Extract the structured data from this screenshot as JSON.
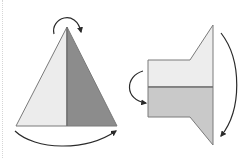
{
  "figure": {
    "colors": {
      "background": "#ffffff",
      "outline": "#7a7a7a",
      "arrow": "#2a2a2a",
      "triangle_left_fill": "#ececec",
      "triangle_right_fill": "#8c8c8c",
      "shape_top_fill": "#ededed",
      "shape_bottom_fill": "#c9c9c9",
      "dotted_edge": "#d6d6d6"
    },
    "left_diagram": {
      "shape": "triangle",
      "halves": [
        "light",
        "dark"
      ],
      "arrows": [
        "top-clockwise-arc",
        "bottom-left-to-right-arc"
      ]
    },
    "right_diagram": {
      "shape": "rectangle-with-flare",
      "halves": [
        "light-top",
        "mid-gray-bottom"
      ],
      "arrows": [
        "left-top-to-bottom-arc",
        "right-top-to-bottom-arc"
      ]
    }
  }
}
